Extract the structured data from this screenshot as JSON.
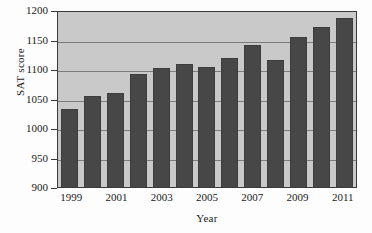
{
  "chart_data": {
    "type": "bar",
    "title": "",
    "xlabel": "Year",
    "ylabel": "SAT score",
    "categories": [
      "1999",
      "2000",
      "2001",
      "2002",
      "2003",
      "2004",
      "2005",
      "2006",
      "2007",
      "2008",
      "2009",
      "2010",
      "2011"
    ],
    "values": [
      1033,
      1054,
      1059,
      1091,
      1102,
      1109,
      1103,
      1119,
      1141,
      1115,
      1154,
      1171,
      1187
    ],
    "ylim": [
      900,
      1200
    ],
    "yticks": [
      900,
      950,
      1000,
      1050,
      1100,
      1150,
      1200
    ],
    "ytick_labels": [
      "900",
      "950",
      "1000",
      "1050",
      "1100",
      "1150",
      "1200"
    ],
    "xtick_labels": [
      "1999",
      "2001",
      "2003",
      "2005",
      "2007",
      "2009",
      "2011"
    ],
    "xtick_categories": [
      "1999",
      "2001",
      "2003",
      "2005",
      "2007",
      "2009",
      "2011"
    ],
    "grid": true,
    "legend": "none",
    "bar_color": "#474747",
    "plot_background": "#c9c9c9",
    "axis_color": "#3a3a3a",
    "grid_color": "#7c7c7c"
  }
}
